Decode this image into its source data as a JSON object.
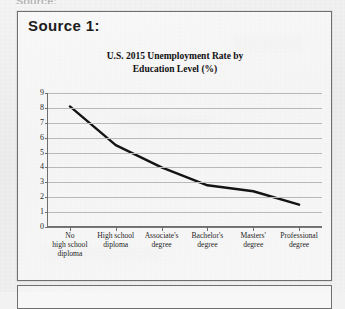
{
  "document": {
    "top_cut_text": "Source:",
    "source_label": "Source 1:"
  },
  "chart_data": {
    "type": "line",
    "title": "U.S. 2015 Unemployment Rate by Education Level (%)",
    "title_lines": [
      "U.S. 2015 Unemployment Rate by",
      "Education Level (%)"
    ],
    "xlabel": "",
    "ylabel": "",
    "ylim": [
      0,
      9
    ],
    "ytick_labels": [
      "0",
      "1",
      "2",
      "3",
      "4",
      "5",
      "6",
      "7",
      "8",
      "9"
    ],
    "grid": true,
    "legend": "none",
    "categories": [
      "No high school diploma",
      "High school diploma",
      "Associate's degree",
      "Bachelor's degree",
      "Masters' degree",
      "Professional degree"
    ],
    "category_label_lines": [
      [
        "No",
        "high school",
        "diploma"
      ],
      [
        "High school",
        "diploma"
      ],
      [
        "Associate's",
        "degree"
      ],
      [
        "Bachelor's",
        "degree"
      ],
      [
        "Masters'",
        "degree"
      ],
      [
        "Professional",
        "degree"
      ]
    ],
    "values": [
      8.1,
      5.5,
      4.0,
      2.8,
      2.4,
      1.5
    ],
    "series": [
      {
        "name": "Unemployment rate",
        "values": [
          8.1,
          5.5,
          4.0,
          2.8,
          2.4,
          1.5
        ]
      }
    ],
    "line_color": "#141414",
    "gridline_color": "#b9b9b9",
    "axis_color": "#6d6d6d"
  }
}
